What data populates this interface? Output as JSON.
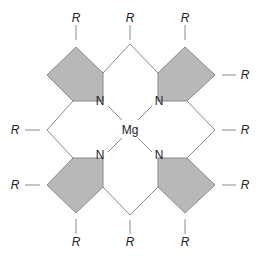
{
  "diagram": {
    "title": "",
    "center_atom": "Mg",
    "nitrogen_label": "N",
    "substituent_label": "R",
    "colors": {
      "ring_fill": "#b8b8b8",
      "bond": "#8a8a8a",
      "text": "#222222"
    },
    "labels": {
      "mg": "Mg",
      "n_tl": "N",
      "n_tr": "N",
      "n_bl": "N",
      "n_br": "N",
      "r_top_left": "R",
      "r_top_mid": "R",
      "r_top_right": "R",
      "r_right_top": "R",
      "r_right_mid": "R",
      "r_right_bottom": "R",
      "r_left_mid": "R",
      "r_left_bottom": "R",
      "r_bottom_left": "R",
      "r_bottom_mid": "R",
      "r_bottom_right": "R"
    }
  }
}
